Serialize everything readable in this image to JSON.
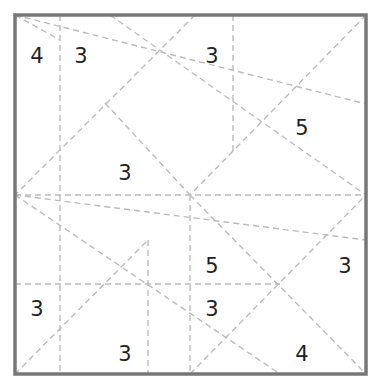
{
  "puzzle": {
    "type": "slice-region number puzzle",
    "board": {
      "x0": 15,
      "y0": 15,
      "x1": 366,
      "y1": 374,
      "border_color": "#777777",
      "border_width": 3.5
    },
    "line_style": {
      "color": "#bbbbbb",
      "width": 1.4,
      "dash": "6 4"
    },
    "lines": [
      [
        60,
        15,
        60,
        374
      ],
      [
        233,
        15,
        233,
        153
      ],
      [
        190,
        195,
        190,
        374
      ],
      [
        148,
        240,
        148,
        374
      ],
      [
        15,
        195,
        366,
        195
      ],
      [
        15,
        284,
        280,
        284
      ],
      [
        15,
        15,
        366,
        104
      ],
      [
        110,
        15,
        366,
        195
      ],
      [
        195,
        15,
        15,
        195
      ],
      [
        366,
        15,
        190,
        195
      ],
      [
        105,
        103,
        190,
        195
      ],
      [
        15,
        195,
        366,
        240
      ],
      [
        15,
        195,
        280,
        374
      ],
      [
        15,
        374,
        148,
        240
      ],
      [
        190,
        195,
        366,
        374
      ],
      [
        190,
        374,
        366,
        195
      ],
      [
        15,
        15,
        60,
        40
      ]
    ],
    "clues": [
      {
        "label": "4",
        "x": 37,
        "y": 56
      },
      {
        "label": "3",
        "x": 81,
        "y": 56
      },
      {
        "label": "3",
        "x": 212,
        "y": 56
      },
      {
        "label": "5",
        "x": 302,
        "y": 128
      },
      {
        "label": "3",
        "x": 125,
        "y": 173
      },
      {
        "label": "5",
        "x": 212,
        "y": 266
      },
      {
        "label": "3",
        "x": 345,
        "y": 266
      },
      {
        "label": "3",
        "x": 37,
        "y": 309
      },
      {
        "label": "3",
        "x": 212,
        "y": 309
      },
      {
        "label": "3",
        "x": 125,
        "y": 354
      },
      {
        "label": "4",
        "x": 302,
        "y": 354
      }
    ]
  }
}
